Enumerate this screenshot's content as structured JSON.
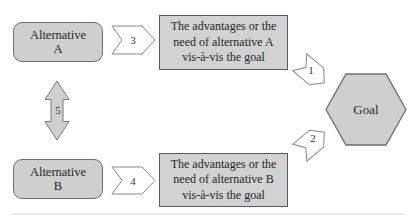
{
  "figure": {
    "nodes": {
      "alternative_a": {
        "label": "Alternative\nA"
      },
      "alternative_b": {
        "label": "Alternative\nB"
      },
      "advantage_a": {
        "label": "The advantages or the\nneed of alternative A\nvis-à-vis the goal"
      },
      "advantage_b": {
        "label": "The advantages or the\nneed of alternative B\nvis-à-vis the goal"
      },
      "goal": {
        "label": "Goal"
      }
    },
    "connectors": {
      "advantage_a_to_goal": {
        "label": "1",
        "direction": "down-right"
      },
      "advantage_b_to_goal": {
        "label": "2",
        "direction": "up-right"
      },
      "alternative_a_to_advantage_a": {
        "label": "3",
        "direction": "right"
      },
      "alternative_b_to_advantage_b": {
        "label": "4",
        "direction": "right"
      },
      "alternative_a_alternative_b": {
        "label": "5",
        "direction": "vertical-double-headed"
      }
    },
    "colors": {
      "background": "#ffffff",
      "node_fill": "#cfcfcf",
      "node_border": "#6e6e6e",
      "textbox_fill": "#d2d2d2",
      "arrow_fill": "#ffffff",
      "double_arrow_fill": "#d0d0d0",
      "arrow_border": "#8a8a8a",
      "text": "#262626"
    }
  }
}
